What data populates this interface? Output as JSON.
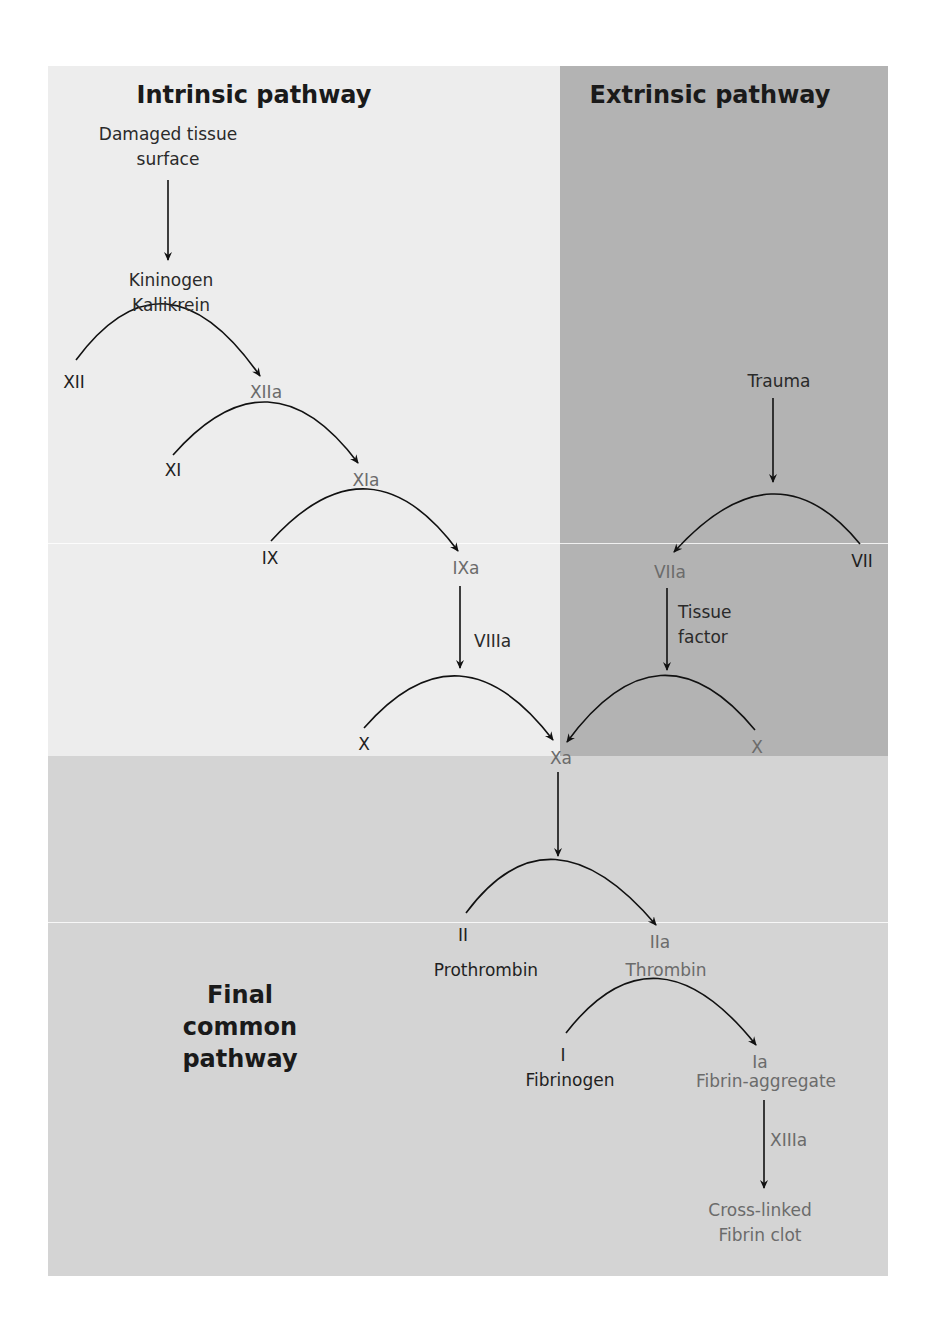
{
  "titles": {
    "intrinsic": "Intrinsic pathway",
    "extrinsic": "Extrinsic pathway",
    "common_line1": "Final",
    "common_line2": "common",
    "common_line3": "pathway"
  },
  "intrinsic": {
    "trigger_line1": "Damaged tissue",
    "trigger_line2": "surface",
    "activators_line1": "Kininogen",
    "activators_line2": "Kallikrein",
    "xii": "XII",
    "xiia": "XIIa",
    "xi": "XI",
    "xia": "XIa",
    "ix": "IX",
    "ixa": "IXa",
    "cofactor": "VIIIa",
    "x": "X"
  },
  "extrinsic": {
    "trigger": "Trauma",
    "vii": "VII",
    "viia": "VIIa",
    "cofactor_line1": "Tissue",
    "cofactor_line2": "factor",
    "x": "X"
  },
  "common": {
    "xa": "Xa",
    "ii": "II",
    "ii_name": "Prothrombin",
    "iia": "IIa",
    "iia_name": "Thrombin",
    "i": "I",
    "i_name": "Fibrinogen",
    "ia": "Ia",
    "ia_name": "Fibrin-aggregate",
    "cofactor": "XIIIa",
    "product_line1": "Cross-linked",
    "product_line2": "Fibrin clot"
  },
  "colors": {
    "input_text": "#1f1f1f",
    "output_text": "#6b6b6b",
    "intrinsic_bg": "#ededed",
    "extrinsic_bg": "#b3b3b3",
    "common_bg": "#d4d4d4"
  }
}
